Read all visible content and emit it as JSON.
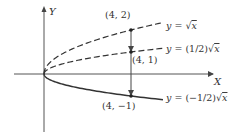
{
  "figure": {
    "axes": {
      "x_label": "X",
      "y_label": "Y",
      "origin_px": [
        44,
        74
      ],
      "unit_px_x": 21.75,
      "unit_px_y": 22,
      "x_axis_px": [
        14,
        213
      ],
      "y_axis_px": [
        6,
        132
      ],
      "color": "#555555"
    },
    "curves": [
      {
        "id": "sqrt",
        "equation": "y = √x",
        "label_prefix": "y = ",
        "label_coef": "",
        "coefficient": 1,
        "style": "dashed",
        "x_max": 5.47,
        "label_pos": [
          166,
          29
        ]
      },
      {
        "id": "half-sqrt",
        "equation": "y = (1/2)√x",
        "label_prefix": "y = ",
        "label_coef": "(1/2)",
        "coefficient": 0.5,
        "style": "dashed",
        "x_max": 5.47,
        "label_pos": [
          166,
          52
        ]
      },
      {
        "id": "neg-half-sqrt",
        "equation": "y = (−1/2)√x",
        "label_prefix": "y = ",
        "label_coef": "(−1/2)",
        "coefficient": -0.5,
        "style": "solid",
        "x_max": 5.47,
        "label_pos": [
          166,
          101
        ]
      }
    ],
    "points": [
      {
        "label": "(4, 2)",
        "x": 4,
        "y": 2,
        "label_pos": [
          105,
          18
        ]
      },
      {
        "label": "(4, 1)",
        "x": 4,
        "y": 1,
        "label_pos": [
          132,
          63
        ]
      },
      {
        "label": "(4, −1)",
        "x": 4,
        "y": -1,
        "label_pos": [
          102,
          109
        ]
      }
    ],
    "arrows": [
      {
        "from": [
          4,
          2
        ],
        "to": [
          4,
          1
        ]
      },
      {
        "from": [
          4,
          1
        ],
        "to": [
          4,
          -1
        ]
      }
    ],
    "line_color": "#333333"
  }
}
